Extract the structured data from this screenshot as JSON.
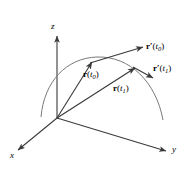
{
  "figure": {
    "background_color": "#ffffff",
    "stroke_color": "#3a3a3a",
    "curve_color": "#6b6b6b",
    "width": 189,
    "height": 173
  },
  "axes": {
    "x_label": "x",
    "y_label": "y",
    "z_label": "z",
    "origin": {
      "x": 57,
      "y": 118
    }
  },
  "vectors": [
    {
      "name": "position-vector-t0",
      "label_bold": "r",
      "label_prime": "",
      "label_arg_open": "(",
      "label_param": "t",
      "label_sub": "0",
      "label_arg_close": ")",
      "from": {
        "x": 57,
        "y": 118
      },
      "to": {
        "x": 92,
        "y": 62
      }
    },
    {
      "name": "position-vector-t1",
      "label_bold": "r",
      "label_prime": "",
      "label_arg_open": "(",
      "label_param": "t",
      "label_sub": "1",
      "label_arg_close": ")",
      "from": {
        "x": 57,
        "y": 118
      },
      "to": {
        "x": 135,
        "y": 68
      }
    },
    {
      "name": "tangent-vector-t0",
      "label_bold": "r",
      "label_prime": "′",
      "label_arg_open": "(",
      "label_param": "t",
      "label_sub": "0",
      "label_arg_close": ")",
      "from": {
        "x": 92,
        "y": 62
      },
      "to": {
        "x": 143,
        "y": 47
      }
    },
    {
      "name": "tangent-vector-t1",
      "label_bold": "r",
      "label_prime": "′",
      "label_arg_open": "(",
      "label_param": "t",
      "label_sub": "1",
      "label_arg_close": ")",
      "from": {
        "x": 135,
        "y": 68
      },
      "to": {
        "x": 153,
        "y": 78
      }
    }
  ],
  "curve": {
    "name": "trajectory-curve",
    "description": "arc of the space curve traced by r(t)"
  }
}
